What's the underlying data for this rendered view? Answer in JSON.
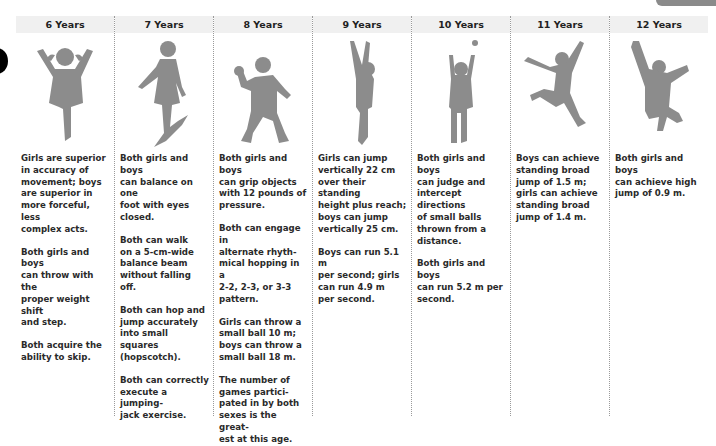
{
  "decor": {
    "silhouette_color": "#8c8c8c",
    "header_bg": "#f0f0f0"
  },
  "columns": [
    {
      "age": "6 Years",
      "figure": "girl-jumping-silhouette",
      "paragraphs": [
        "Girls are superior\nin accuracy of\nmovement; boys\nare superior in\nmore forceful, less\ncomplex acts.",
        "Both girls and boys\ncan throw with the\nproper weight shift\nand step.",
        "Both acquire the\nability to skip."
      ]
    },
    {
      "age": "7 Years",
      "figure": "girl-balancing-silhouette",
      "paragraphs": [
        "Both girls and boys\ncan balance on one\nfoot with eyes\nclosed.",
        "Both can walk\non a 5-cm-wide\nbalance beam\nwithout falling off.",
        "Both can hop and\njump accurately\ninto small squares\n(hopscotch).",
        "Both can correctly\nexecute a jumping-\njack exercise."
      ]
    },
    {
      "age": "8 Years",
      "figure": "boy-throwing-silhouette",
      "paragraphs": [
        "Both girls and boys\ncan grip objects\nwith 12 pounds of\npressure.",
        "Both can engage in\nalternate rhyth-\nmical hopping in a\n2-2, 2-3, or 3-3\npattern.",
        "Girls can throw a\nsmall ball 10 m;\nboys can throw a\nsmall ball 18 m.",
        "The number of\ngames partici-\npated in by both\nsexes is the great-\nest at this age."
      ]
    },
    {
      "age": "9 Years",
      "figure": "child-reaching-up-silhouette",
      "paragraphs": [
        "Girls can jump\nvertically 22 cm\nover their standing\nheight plus reach;\nboys can jump\nvertically 25 cm.",
        "Boys can run 5.1 m\nper second; girls\ncan run 4.9 m\nper second."
      ]
    },
    {
      "age": "10 Years",
      "figure": "girl-catching-ball-silhouette",
      "paragraphs": [
        "Both girls and boys\ncan judge and\nintercept directions\nof small balls\nthrown from a\ndistance.",
        "Both girls and boys\ncan run 5.2 m per\nsecond."
      ]
    },
    {
      "age": "11 Years",
      "figure": "girl-leaping-silhouette",
      "paragraphs": [
        "Boys can achieve\nstanding broad\njump of 1.5 m;\ngirls can achieve\nstanding broad\njump of 1.4 m."
      ]
    },
    {
      "age": "12 Years",
      "figure": "boy-high-jump-silhouette",
      "paragraphs": [
        "Both girls and boys\ncan achieve high\njump of 0.9 m."
      ]
    }
  ]
}
